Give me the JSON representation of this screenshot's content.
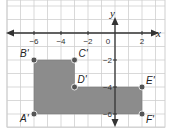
{
  "diagram": {
    "type": "coordinate-plane",
    "axes": {
      "x_label": "x",
      "y_label": "y",
      "x_ticks": [
        {
          "value": -6,
          "label": "−6"
        },
        {
          "value": -4,
          "label": "−4"
        },
        {
          "value": -2,
          "label": "−2"
        },
        {
          "value": 0,
          "label": "0"
        },
        {
          "value": 2,
          "label": "2"
        }
      ],
      "y_ticks": [
        {
          "value": -2,
          "label": "−2"
        },
        {
          "value": -4,
          "label": "−4"
        },
        {
          "value": -6,
          "label": "−6"
        }
      ]
    },
    "polygon": {
      "fill": "#8c8c8c",
      "vertices": [
        {
          "name": "A'",
          "x": -6,
          "y": -6
        },
        {
          "name": "B'",
          "x": -6,
          "y": -2
        },
        {
          "name": "C'",
          "x": -3,
          "y": -2
        },
        {
          "name": "D'",
          "x": -3,
          "y": -4
        },
        {
          "name": "E'",
          "x": 2,
          "y": -4
        },
        {
          "name": "F'",
          "x": 2,
          "y": -6
        }
      ]
    },
    "colors": {
      "grid": "#cfcfcf",
      "axis": "#333333",
      "point": "#555555"
    }
  }
}
